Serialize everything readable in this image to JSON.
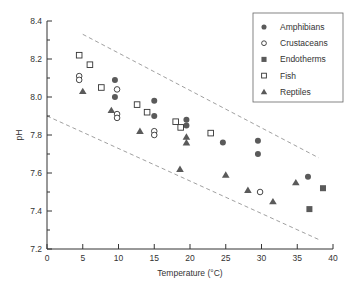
{
  "chart_data": {
    "type": "scatter",
    "title": "",
    "xlabel": "Temperature (°C)",
    "ylabel": "pH",
    "xlim": [
      0,
      40
    ],
    "ylim": [
      7.2,
      8.4
    ],
    "xticks": [
      0,
      5,
      10,
      15,
      20,
      25,
      30,
      35,
      40
    ],
    "yticks": [
      7.2,
      7.4,
      7.6,
      7.8,
      8.0,
      8.2,
      8.4
    ],
    "grid": false,
    "legend_position": "upper right",
    "series": [
      {
        "name": "Amphibians",
        "marker": "filled-circle",
        "points": [
          [
            9.5,
            8.09
          ],
          [
            9.5,
            8.0
          ],
          [
            15,
            7.98
          ],
          [
            15,
            7.9
          ],
          [
            19.5,
            7.88
          ],
          [
            19.5,
            7.85
          ],
          [
            24.6,
            7.76
          ],
          [
            29.5,
            7.77
          ],
          [
            29.5,
            7.7
          ],
          [
            36.5,
            7.58
          ]
        ]
      },
      {
        "name": "Crustaceans",
        "marker": "open-circle",
        "points": [
          [
            4.5,
            8.11
          ],
          [
            4.5,
            8.09
          ],
          [
            9.8,
            8.04
          ],
          [
            9.8,
            7.91
          ],
          [
            9.8,
            7.89
          ],
          [
            15,
            7.82
          ],
          [
            15,
            7.8
          ],
          [
            29.8,
            7.5
          ]
        ]
      },
      {
        "name": "Endotherms",
        "marker": "filled-square",
        "points": [
          [
            36.7,
            7.41
          ],
          [
            38.6,
            7.52
          ]
        ]
      },
      {
        "name": "Fish",
        "marker": "open-square",
        "points": [
          [
            4.5,
            8.22
          ],
          [
            6.0,
            8.17
          ],
          [
            7.6,
            8.05
          ],
          [
            12.6,
            7.96
          ],
          [
            14.0,
            7.92
          ],
          [
            18.0,
            7.87
          ],
          [
            18.7,
            7.84
          ],
          [
            22.9,
            7.81
          ]
        ]
      },
      {
        "name": "Reptiles",
        "marker": "filled-triangle",
        "points": [
          [
            5.0,
            8.03
          ],
          [
            9.0,
            7.93
          ],
          [
            13.0,
            7.82
          ],
          [
            19.5,
            7.79
          ],
          [
            19.5,
            7.76
          ],
          [
            18.6,
            7.62
          ],
          [
            25.0,
            7.59
          ],
          [
            28.1,
            7.51
          ],
          [
            31.6,
            7.45
          ],
          [
            34.8,
            7.55
          ]
        ]
      }
    ],
    "reference_lines": [
      {
        "name": "upper-bound",
        "style": "dashed",
        "points": [
          [
            5,
            8.33
          ],
          [
            38,
            7.68
          ]
        ]
      },
      {
        "name": "lower-bound",
        "style": "dashed",
        "points": [
          [
            0,
            7.9
          ],
          [
            38,
            7.25
          ]
        ]
      }
    ]
  },
  "axes": {
    "x_label": "Temperature (°C)",
    "y_label": "pH"
  },
  "colors": {
    "marker": "#5a5a5a",
    "axis": "#333333",
    "dash": "#888888"
  }
}
